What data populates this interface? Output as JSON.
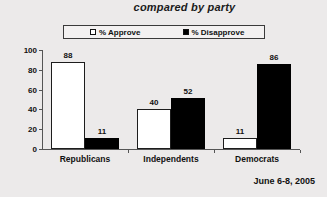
{
  "title": "compared by party",
  "footer": {
    "date": "June 6-8, 2005"
  },
  "legend": {
    "approve": {
      "label": "% Approve",
      "swatch": "hollow-square-icon"
    },
    "disapprove": {
      "label": "% Disapprove",
      "swatch": "filled-square-icon"
    }
  },
  "chart_data": {
    "type": "bar",
    "title": "compared by party",
    "xlabel": "",
    "ylabel": "",
    "ylim": [
      0,
      100
    ],
    "yticks": [
      0,
      20,
      40,
      60,
      80,
      100
    ],
    "grid": false,
    "legend_position": "top",
    "categories": [
      "Republicans",
      "Independents",
      "Democrats"
    ],
    "series": [
      {
        "name": "% Approve",
        "color": "#ffffff",
        "values": [
          88,
          40,
          11
        ]
      },
      {
        "name": "% Disapprove",
        "color": "#000000",
        "values": [
          11,
          52,
          86
        ]
      }
    ],
    "annotations": [
      "June 6-8, 2005"
    ]
  }
}
